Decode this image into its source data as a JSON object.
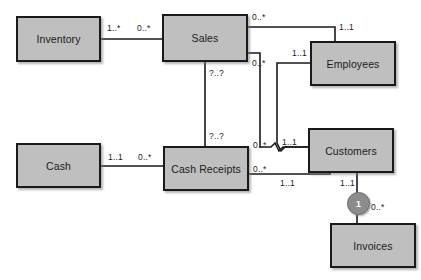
{
  "diagram": {
    "type": "uml-class-diagram",
    "colors": {
      "entity_fill": "#bfbfbf",
      "entity_border": "#1a1a1a",
      "line": "#1a1a1a",
      "constraint_fill": "#8c8c8c",
      "background": "#ffffff"
    },
    "entities": [
      {
        "id": "inventory",
        "label": "Inventory",
        "x": 16,
        "y": 16,
        "w": 85,
        "h": 46
      },
      {
        "id": "sales",
        "label": "Sales",
        "x": 162,
        "y": 14,
        "w": 86,
        "h": 48
      },
      {
        "id": "employees",
        "label": "Employees",
        "x": 310,
        "y": 41,
        "w": 86,
        "h": 45
      },
      {
        "id": "cash",
        "label": "Cash",
        "x": 16,
        "y": 143,
        "w": 85,
        "h": 45
      },
      {
        "id": "cash_receipts",
        "label": "Cash Receipts",
        "x": 163,
        "y": 146,
        "w": 86,
        "h": 45
      },
      {
        "id": "customers",
        "label": "Customers",
        "x": 308,
        "y": 128,
        "w": 86,
        "h": 45
      },
      {
        "id": "invoices",
        "label": "Invoices",
        "x": 330,
        "y": 223,
        "w": 86,
        "h": 45
      }
    ],
    "relationships": [
      {
        "id": "inventory-sales",
        "from": "inventory",
        "to": "sales",
        "from_mult": "1..*",
        "to_mult": "0..*"
      },
      {
        "id": "sales-employees",
        "from": "sales",
        "to": "employees",
        "from_mult": "0..*",
        "to_mult": "1..1"
      },
      {
        "id": "sales-cash-receipts",
        "from": "sales",
        "to": "cash_receipts",
        "from_mult": "?..?",
        "to_mult": "?..?"
      },
      {
        "id": "sales-customers",
        "from": "sales",
        "to": "customers",
        "from_mult": "0..*",
        "to_mult": "1..1"
      },
      {
        "id": "cash-cash-receipts",
        "from": "cash",
        "to": "cash_receipts",
        "from_mult": "1..1",
        "to_mult": "0..*"
      },
      {
        "id": "cash-receipts-customers",
        "from": "cash_receipts",
        "to": "customers",
        "from_mult": "0..*",
        "to_mult": "1..1"
      },
      {
        "id": "employees-customers",
        "from": "employees",
        "to": "customers",
        "from_mult": "1..1",
        "to_mult": "1..1"
      },
      {
        "id": "customers-invoices",
        "from": "customers",
        "to": "invoices",
        "from_mult": "1..1",
        "to_mult": "0..*"
      }
    ],
    "constraint_markers": [
      {
        "id": "constraint-1",
        "label": "1",
        "x": 347,
        "y": 192
      }
    ],
    "multiplicity_labels": [
      {
        "id": "m-inventory-right",
        "text": "1..*",
        "x": 107,
        "y": 23
      },
      {
        "id": "m-sales-left",
        "text": "0..*",
        "x": 137,
        "y": 23
      },
      {
        "id": "m-sales-top-right",
        "text": "0..*",
        "x": 252,
        "y": 12
      },
      {
        "id": "m-employees-top",
        "text": "1..1",
        "x": 339,
        "y": 22
      },
      {
        "id": "m-sales-bottom-right",
        "text": "0..*",
        "x": 252,
        "y": 58
      },
      {
        "id": "m-employees-left",
        "text": "1..1",
        "x": 292,
        "y": 48
      },
      {
        "id": "m-sales-bottom",
        "text": "?..?",
        "x": 209,
        "y": 68
      },
      {
        "id": "m-cash-receipts-top",
        "text": "?..?",
        "x": 209,
        "y": 131
      },
      {
        "id": "m-cash-right",
        "text": "1..1",
        "x": 108,
        "y": 152
      },
      {
        "id": "m-cash-receipts-left",
        "text": "0..*",
        "x": 138,
        "y": 152
      },
      {
        "id": "m-customers-left",
        "text": "1..1",
        "x": 282,
        "y": 137
      },
      {
        "id": "m-cash-receipts-right-1",
        "text": "0..*",
        "x": 253,
        "y": 140
      },
      {
        "id": "m-cash-receipts-right-2",
        "text": "0..*",
        "x": 253,
        "y": 164
      },
      {
        "id": "m-customers-bottom-left",
        "text": "1..1",
        "x": 280,
        "y": 178
      },
      {
        "id": "m-customers-bottom-right",
        "text": "1..1",
        "x": 340,
        "y": 178
      },
      {
        "id": "m-invoices-top",
        "text": "0..*",
        "x": 371,
        "y": 202
      }
    ]
  }
}
